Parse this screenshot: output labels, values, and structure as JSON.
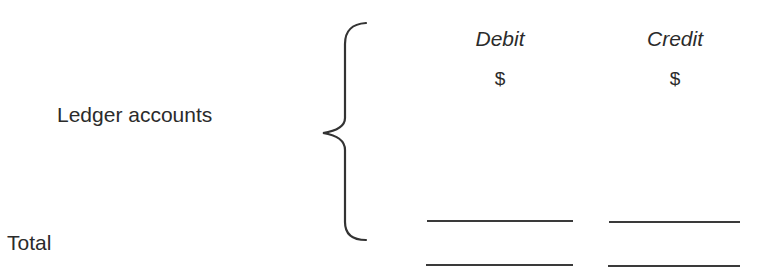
{
  "ledger": {
    "row_label": "Ledger accounts",
    "total_label": "Total",
    "columns": [
      {
        "header": "Debit",
        "currency": "$"
      },
      {
        "header": "Credit",
        "currency": "$"
      }
    ],
    "brace_icon": "curly-brace-left"
  }
}
